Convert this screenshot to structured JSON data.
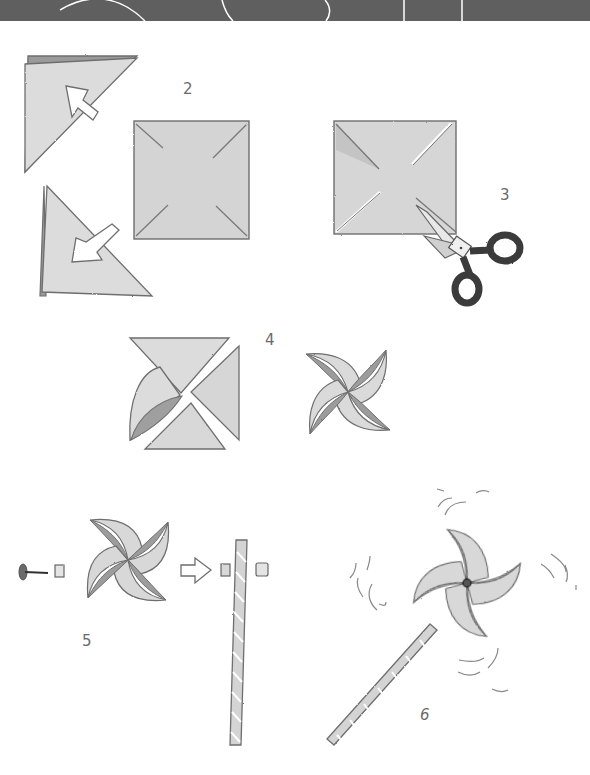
{
  "document": {
    "type": "illustrated-instructions",
    "subject": "paper pinwheel craft",
    "steps": [
      {
        "number": "2",
        "description": "Fold the square paper corner to corner both ways, then unfold to show diagonal creases"
      },
      {
        "number": "3",
        "description": "Cut along each diagonal crease from the corners toward the center with scissors"
      },
      {
        "number": "4",
        "description": "Bring alternating corners to the center to form the pinwheel"
      },
      {
        "number": "5",
        "description": "Push a pin through a bead, the pinwheel center, another bead and into the stick"
      },
      {
        "number": "6",
        "description": "Finished pinwheel spinning on its stick"
      }
    ]
  },
  "labels": {
    "step2": "2",
    "step3": "3",
    "step4": "4",
    "step5": "5",
    "step6": "6"
  },
  "icons": {
    "fold_arrow": "arrow-icon",
    "scissors": "scissors-icon",
    "pin": "pin-icon",
    "bead": "bead-icon",
    "stick": "stick-icon",
    "motion_lines": "motion-lines-icon"
  },
  "colors": {
    "header_band": "#5f5f5f",
    "paper_light": "#d8d8d8",
    "paper_dark": "#a9a9a9",
    "outline": "#6e6e6e",
    "scissors_handle": "#3a3a3a",
    "background": "#ffffff"
  }
}
